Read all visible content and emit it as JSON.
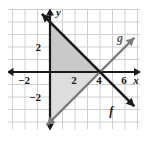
{
  "figure": {
    "kind": "coordinate-plane-graph",
    "background_color": "#ffffff",
    "grid_color": "#cfcfcf",
    "axis_color": "#1a1a1a",
    "shade_color": "#c9c9c9",
    "shade_color_light": "#dcdcdc"
  },
  "axes": {
    "x_label": "x",
    "y_label": "y",
    "x_ticks": [
      {
        "value": -2,
        "label": "−2"
      },
      {
        "value": 2,
        "label": "2"
      },
      {
        "value": 4,
        "label": "4"
      },
      {
        "value": 6,
        "label": "6"
      }
    ],
    "y_ticks": [
      {
        "value": 2,
        "label": "2"
      },
      {
        "value": -2,
        "label": "−2"
      }
    ],
    "x_range": [
      -3.4,
      7.2
    ],
    "y_range": [
      -4.6,
      5.0
    ],
    "grid_step": 1,
    "grid_on": true
  },
  "lines": {
    "f": {
      "label": "f",
      "slope": -1,
      "intercept": 4,
      "color": "#1a1a1a",
      "stroke_width": 2.6,
      "label_position": {
        "x": 4.9,
        "y": -3.4
      }
    },
    "g": {
      "label": "g",
      "slope": 1,
      "intercept": -4,
      "color": "#7a7a7a",
      "stroke_width": 2.2,
      "label_position": {
        "x": 5.6,
        "y": 2.4
      }
    }
  },
  "intersection": {
    "x": 4,
    "y": 0
  },
  "shaded_regions": [
    {
      "name": "triangle-quadrant-one",
      "vertices": [
        [
          0,
          0
        ],
        [
          0,
          4
        ],
        [
          4,
          0
        ]
      ],
      "fill": "#c9c9c9"
    },
    {
      "name": "wedge-below-x-axis",
      "vertices": [
        [
          0,
          0
        ],
        [
          4,
          0
        ],
        [
          0,
          -4
        ]
      ],
      "fill": "#dddddd"
    }
  ],
  "chart_data": {
    "type": "line",
    "title": "",
    "xlabel": "x",
    "ylabel": "y",
    "xlim": [
      -3.4,
      7.2
    ],
    "ylim": [
      -4.6,
      5.0
    ],
    "grid": true,
    "legend": "inline-labels",
    "xticks": [
      -2,
      2,
      4,
      6
    ],
    "yticks": [
      2,
      -2
    ],
    "series": [
      {
        "name": "f",
        "equation": "y = -x + 4",
        "x": [
          -1,
          0,
          2,
          4,
          6,
          7
        ],
        "values": [
          5,
          4,
          2,
          0,
          -2,
          -3
        ]
      },
      {
        "name": "g",
        "equation": "y = x - 4",
        "x": [
          -1,
          0,
          2,
          4,
          6,
          7
        ],
        "values": [
          -5,
          -4,
          -2,
          0,
          2,
          3
        ]
      }
    ],
    "annotations": [
      {
        "text": "f",
        "x": 4.9,
        "y": -3.4
      },
      {
        "text": "g",
        "x": 5.6,
        "y": 2.4
      }
    ]
  }
}
